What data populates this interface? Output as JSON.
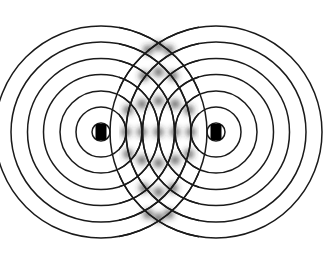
{
  "figure": {
    "title": "Two-source circular wave interference pattern",
    "width": 323,
    "height": 259,
    "background_color": "#ffffff",
    "wave_color": "#1a1a1a",
    "source_marker_color": "#000000",
    "interference_blur_color": "#2b2b2b"
  },
  "chart_data": {
    "type": "scatter",
    "title": "Two-source circular wave interference pattern",
    "subtitle": "",
    "xlabel": "",
    "ylabel": "",
    "grid": false,
    "legend_position": "none",
    "xlim": [
      0,
      323
    ],
    "ylim": [
      0,
      259
    ],
    "sources": [
      {
        "name": "source-left",
        "label": "S1",
        "cx": 101,
        "cy": 132,
        "marker_width": 11,
        "marker_height": 16,
        "marker_shape": "rounded-rect",
        "ring_count": 7,
        "ring_spacing": 16.2,
        "ring_radii": [
          9,
          25,
          41,
          57.5,
          73.5,
          90,
          106
        ]
      },
      {
        "name": "source-right",
        "label": "S2",
        "cx": 216,
        "cy": 132,
        "marker_width": 11,
        "marker_height": 16,
        "marker_shape": "rounded-rect",
        "ring_count": 7,
        "ring_spacing": 16.2,
        "ring_radii": [
          9,
          25,
          41,
          57.5,
          73.5,
          90,
          106
        ]
      }
    ],
    "source_separation": 115,
    "wavelength": 16.2,
    "stroke_width": 1.5,
    "antinode_region": {
      "x_center": 158.5,
      "x_half_width": 36,
      "y_top": 30,
      "y_bottom": 235,
      "blur_radius": 5,
      "description": "blurred constructive-interference crossings along the perpendicular bisector"
    },
    "antinode_points": [
      {
        "x": 158.5,
        "y": 132
      },
      {
        "x": 142,
        "y": 132
      },
      {
        "x": 175,
        "y": 132
      },
      {
        "x": 126,
        "y": 132
      },
      {
        "x": 191,
        "y": 132
      },
      {
        "x": 158.5,
        "y": 101
      },
      {
        "x": 158.5,
        "y": 163
      },
      {
        "x": 142,
        "y": 104
      },
      {
        "x": 175,
        "y": 104
      },
      {
        "x": 142,
        "y": 160
      },
      {
        "x": 175,
        "y": 160
      },
      {
        "x": 128,
        "y": 110
      },
      {
        "x": 189,
        "y": 110
      },
      {
        "x": 128,
        "y": 154
      },
      {
        "x": 189,
        "y": 154
      },
      {
        "x": 158.5,
        "y": 72
      },
      {
        "x": 158.5,
        "y": 192
      },
      {
        "x": 144,
        "y": 76
      },
      {
        "x": 173,
        "y": 76
      },
      {
        "x": 144,
        "y": 188
      },
      {
        "x": 173,
        "y": 188
      },
      {
        "x": 158.5,
        "y": 46
      },
      {
        "x": 158.5,
        "y": 218
      },
      {
        "x": 148,
        "y": 50
      },
      {
        "x": 169,
        "y": 50
      },
      {
        "x": 148,
        "y": 214
      },
      {
        "x": 169,
        "y": 214
      }
    ]
  },
  "accessibility": {
    "alt_text": "Diagram of two identical circular wave sources emitting seven concentric wavefronts each; the wavefronts overlap in the centre producing a blurred interference pattern"
  }
}
